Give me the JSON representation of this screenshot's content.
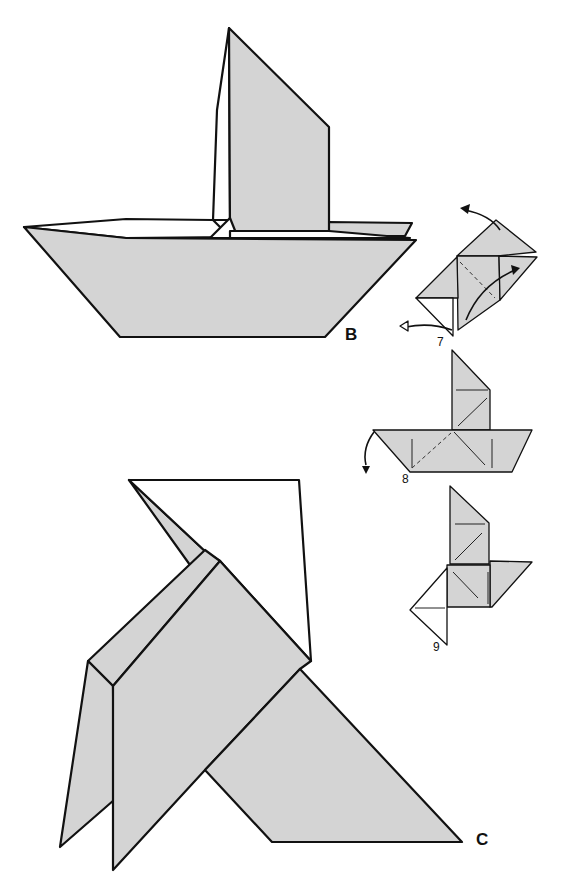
{
  "figures": [
    {
      "id": "B",
      "label": "B",
      "description": "Finished sailboat"
    },
    {
      "id": "C",
      "label": "C",
      "description": "Finished bird"
    }
  ],
  "steps": [
    {
      "number": "7",
      "description": "Open flaps outward (arrows)"
    },
    {
      "number": "8",
      "description": "Fold down along dashed line"
    },
    {
      "number": "9",
      "description": "Result"
    }
  ],
  "colors": {
    "paper": "#d4d4d4",
    "outline": "#111111",
    "background": "#ffffff"
  }
}
